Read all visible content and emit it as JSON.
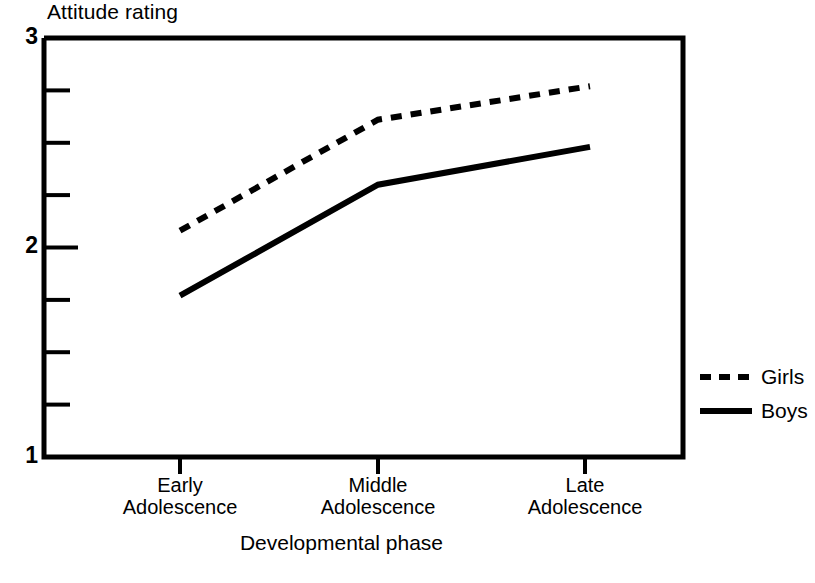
{
  "chart_data": {
    "type": "line",
    "title": "",
    "ylabel": "Attitude rating",
    "xlabel": "Developmental phase",
    "categories": [
      "Early\nAdolescence",
      "Middle\nAdolescence",
      "Late\nAdolescence"
    ],
    "category_lines": [
      [
        "Early",
        "Adolescence"
      ],
      [
        "Middle",
        "Adolescence"
      ],
      [
        "Late",
        "Adolescence"
      ]
    ],
    "series": [
      {
        "name": "Girls",
        "style": "dashed",
        "color": "#000000",
        "values": [
          2.08,
          2.61,
          2.77
        ]
      },
      {
        "name": "Boys",
        "style": "solid",
        "color": "#000000",
        "values": [
          1.77,
          2.3,
          2.48
        ]
      }
    ],
    "ylim": [
      1,
      3
    ],
    "ytick_labels": [
      "3",
      "2",
      "1"
    ],
    "ytick_values": [
      3,
      2,
      1
    ],
    "yminor_ticks": [
      2.75,
      2.5,
      2.25,
      1.75,
      1.5,
      1.25
    ],
    "grid": false,
    "legend_position": "right",
    "legend_entries": [
      {
        "label": "Girls",
        "style": "dashed"
      },
      {
        "label": "Boys",
        "style": "solid"
      }
    ]
  },
  "axis": {
    "y_axis_title": "Attitude rating",
    "x_axis_title": "Developmental phase"
  }
}
